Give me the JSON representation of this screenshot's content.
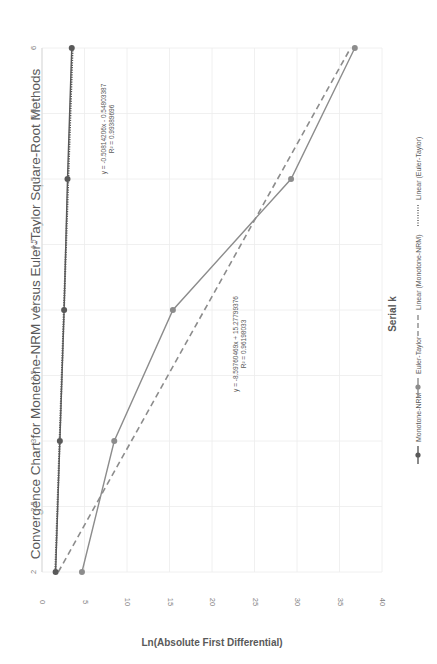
{
  "chart_data": {
    "type": "line",
    "title": "Convergence Chart for Monetone-NRM versus Euler-Taylor Square-Root Methods",
    "xlabel": "Serial k",
    "ylabel": "Ln(Absolute First Differential)",
    "x": [
      2,
      3,
      4,
      5,
      6
    ],
    "xlim": [
      2,
      6
    ],
    "xticks": [
      "2",
      "2.5",
      "3",
      "3.5",
      "4",
      "4.5",
      "5",
      "5.5",
      "6"
    ],
    "ylim": [
      -40,
      0
    ],
    "yticks": [
      "0",
      "-5",
      "-10",
      "-15",
      "-20",
      "-25",
      "-30",
      "-35",
      "-40"
    ],
    "y_axis_reversed": true,
    "grid": true,
    "legend_position": "bottom",
    "series": [
      {
        "name": "Monotone-NRM",
        "values": [
          -1.6,
          -2.1,
          -2.6,
          -3.0,
          -3.5
        ],
        "color": "#595959",
        "style": "solid-marker"
      },
      {
        "name": "Euler-Taylor",
        "values": [
          -4.7,
          -8.5,
          -15.4,
          -29.3,
          -36.8
        ],
        "color": "#8c8c8c",
        "style": "solid-marker"
      }
    ],
    "trendlines": [
      {
        "name": "Linear (Monotone-NRM)",
        "equation": "y = -0.50814206x - 0.54803387",
        "r2": "R² = 0.99389696",
        "slope": -0.50814206,
        "intercept": -0.54803387,
        "style": "dotted"
      },
      {
        "name": "Linear (Euler-Taylor)",
        "equation": "y = -8.59760469x + 15.27799376",
        "r2": "R² = 0.96198033",
        "slope": -8.59760469,
        "intercept": 15.27799376,
        "style": "dashed"
      }
    ]
  },
  "legend": {
    "items": [
      {
        "label": "Monotone-NRM"
      },
      {
        "label": "Euler-Taylor"
      },
      {
        "label": "Linear (Monotone-NRM)"
      },
      {
        "label": "Linear (Euler-Taylor)"
      }
    ]
  }
}
